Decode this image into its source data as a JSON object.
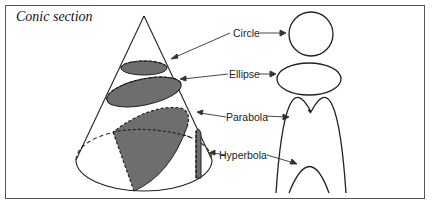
{
  "title": "Conic section",
  "labels": {
    "circle": "Circle",
    "ellipse": "Ellipse",
    "parabola": "Parabola",
    "hyperbola": "Hyperbola"
  },
  "colors": {
    "section_fill": "#6e6e6e",
    "stroke": "#222222",
    "border": "#555555"
  }
}
